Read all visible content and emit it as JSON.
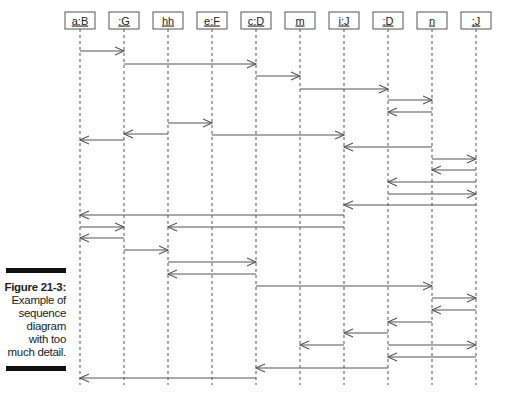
{
  "figure": {
    "number": "Figure 21-3:",
    "caption_lines": [
      "Example of",
      "sequence",
      "diagram",
      "with too",
      "much detail."
    ]
  },
  "lifelines": [
    {
      "id": "aB",
      "label": "a:B"
    },
    {
      "id": "G",
      "label": ":G"
    },
    {
      "id": "hh",
      "label": "hh"
    },
    {
      "id": "eF",
      "label": "e:F"
    },
    {
      "id": "cD",
      "label": "c:D"
    },
    {
      "id": "m",
      "label": "m"
    },
    {
      "id": "iJ",
      "label": "i:J"
    },
    {
      "id": "D",
      "label": ":D"
    },
    {
      "id": "n",
      "label": "n"
    },
    {
      "id": "J",
      "label": ";J"
    }
  ],
  "messages": [
    {
      "from": "aB",
      "to": "G"
    },
    {
      "from": "G",
      "to": "cD"
    },
    {
      "from": "cD",
      "to": "m"
    },
    {
      "from": "m",
      "to": "D"
    },
    {
      "from": "D",
      "to": "n"
    },
    {
      "from": "n",
      "to": "D"
    },
    {
      "from": "hh",
      "to": "eF"
    },
    {
      "from": "hh",
      "to": "G"
    },
    {
      "from": "eF",
      "to": "iJ"
    },
    {
      "from": "G",
      "to": "aB"
    },
    {
      "from": "n",
      "to": "iJ"
    },
    {
      "from": "n",
      "to": "J"
    },
    {
      "from": "J",
      "to": "n"
    },
    {
      "from": "J",
      "to": "D"
    },
    {
      "from": "D",
      "to": "J"
    },
    {
      "from": "J",
      "to": "iJ"
    },
    {
      "from": "iJ",
      "to": "aB"
    },
    {
      "from": "aB",
      "to": "G"
    },
    {
      "from": "iJ",
      "to": "hh"
    },
    {
      "from": "G",
      "to": "aB"
    },
    {
      "from": "G",
      "to": "hh"
    },
    {
      "from": "hh",
      "to": "cD"
    },
    {
      "from": "cD",
      "to": "hh"
    },
    {
      "from": "cD",
      "to": "n"
    },
    {
      "from": "n",
      "to": "J"
    },
    {
      "from": "J",
      "to": "n"
    },
    {
      "from": "n",
      "to": "D"
    },
    {
      "from": "D",
      "to": "iJ"
    },
    {
      "from": "iJ",
      "to": "m"
    },
    {
      "from": "D",
      "to": "J"
    },
    {
      "from": "J",
      "to": "D"
    },
    {
      "from": "D",
      "to": "cD"
    },
    {
      "from": "cD",
      "to": "aB"
    }
  ],
  "colors": {
    "line": "#555555",
    "box_border": "#555555",
    "text": "#222222"
  }
}
